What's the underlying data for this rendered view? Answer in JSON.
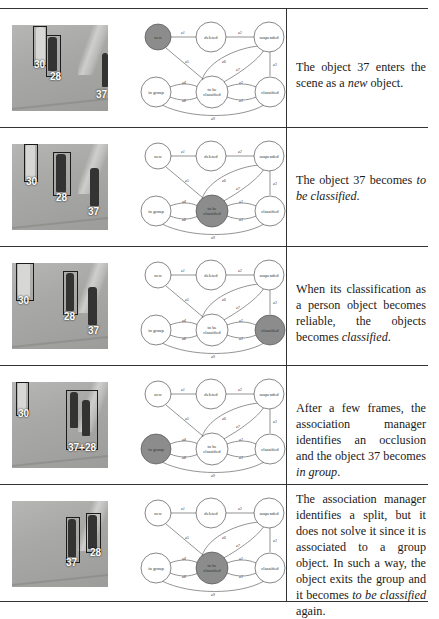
{
  "states": {
    "new": "new",
    "deleted": "deleted",
    "suspended": "suspended",
    "in_group": "in group",
    "to_be_classified_1": "to be",
    "to_be_classified_2": "classified",
    "classified": "classified"
  },
  "edges": {
    "new_deleted": "e1",
    "deleted_suspended": "e2",
    "classified_suspended": "e3",
    "new_tbc": "e5",
    "tbc_suspended_a": "e6",
    "tbc_suspended_b": "e7",
    "tbc_group_a": "e4",
    "tbc_group_b": "e8",
    "tbc_class_a": "e2",
    "tbc_class_b": "e3",
    "group_class": "e9"
  },
  "rows": [
    {
      "active_state": "new",
      "labels": [
        "30",
        "28",
        "37"
      ],
      "description_parts": [
        "The object 37 enters the scene as a ",
        "new",
        " object."
      ]
    },
    {
      "active_state": "to_be_classified",
      "labels": [
        "30",
        "28",
        "37"
      ],
      "description_parts": [
        "The object 37 becomes ",
        "to be classified",
        "."
      ]
    },
    {
      "active_state": "classified",
      "labels": [
        "30",
        "28",
        "37"
      ],
      "description_parts": [
        "When its classification as a person object becomes reliable, the objects becomes ",
        "classified",
        "."
      ]
    },
    {
      "active_state": "in_group",
      "labels": [
        "30",
        "37+28"
      ],
      "description_parts": [
        "After a few frames, the association manager identifies an occlusion and the object 37 becomes ",
        "in group",
        "."
      ]
    },
    {
      "active_state": "to_be_classified",
      "labels": [
        "37",
        "28"
      ],
      "description_parts": [
        "The association manager identifies a split, but it does not solve it since it is associated to a group object. In such a way, the object exits the group and it becomes ",
        "to be classified",
        " again."
      ]
    }
  ],
  "colors": {
    "active_fill": "#8c8c8c",
    "node_stroke": "#555555",
    "rule": "#333333"
  }
}
